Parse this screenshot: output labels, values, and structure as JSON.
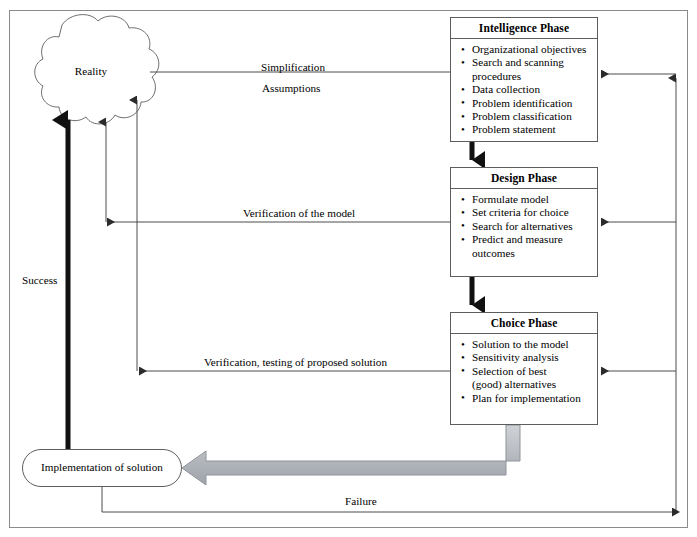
{
  "diagram": {
    "title_hidden": "",
    "nodes": {
      "reality": {
        "label": "Reality",
        "shape": "cloud"
      },
      "implementation": {
        "label": "Implementation of solution",
        "shape": "rounded-rectangle"
      }
    },
    "phases": [
      {
        "id": "intelligence",
        "title": "Intelligence Phase",
        "items": [
          "Organizational objectives",
          "Search and scanning",
          "procedures",
          "Data collection",
          "Problem identification",
          "Problem classification",
          "Problem statement"
        ],
        "continuation_indexes": [
          2
        ]
      },
      {
        "id": "design",
        "title": "Design Phase",
        "items": [
          "Formulate model",
          "Set criteria for choice",
          "Search for alternatives",
          "Predict and measure",
          "outcomes"
        ],
        "continuation_indexes": [
          4
        ]
      },
      {
        "id": "choice",
        "title": "Choice Phase",
        "items": [
          "Solution to the model",
          "Sensitivity analysis",
          "Selection of best",
          "(good) alternatives",
          "Plan for implementation"
        ],
        "continuation_indexes": [
          3
        ]
      }
    ],
    "edge_labels": {
      "simplification": "Simplification",
      "assumptions": "Assumptions",
      "verification_model": "Verification of the model",
      "verification_solution": "Verification, testing of proposed solution",
      "success": "Success",
      "failure": "Failure"
    },
    "colors": {
      "line": "#4d4d4d",
      "box_border": "#5d5d5d",
      "frame_border": "#8a8a8a",
      "thick_arrow": "#111111",
      "grey_arrow_fill": "#b5b8bd",
      "grey_arrow_stroke": "#8f949a",
      "text": "#000000",
      "background": "#ffffff"
    }
  }
}
